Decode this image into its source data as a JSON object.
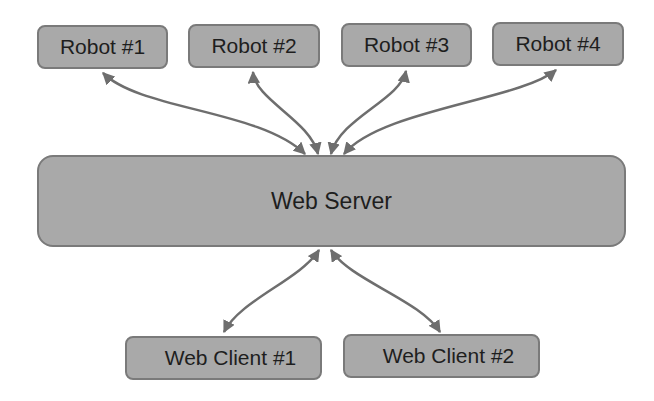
{
  "diagram": {
    "type": "architecture",
    "nodes": {
      "robots": [
        {
          "id": "robot-1",
          "label": "Robot #1"
        },
        {
          "id": "robot-2",
          "label": "Robot #2"
        },
        {
          "id": "robot-3",
          "label": "Robot #3"
        },
        {
          "id": "robot-4",
          "label": "Robot #4"
        }
      ],
      "server": {
        "id": "web-server",
        "label": "Web Server"
      },
      "clients": [
        {
          "id": "web-client-1",
          "label": "Web Client #1"
        },
        {
          "id": "web-client-2",
          "label": "Web Client #2"
        }
      ]
    },
    "edges": [
      {
        "from": "Robot #1",
        "to": "Web Server",
        "direction": "bidirectional"
      },
      {
        "from": "Robot #2",
        "to": "Web Server",
        "direction": "bidirectional"
      },
      {
        "from": "Robot #3",
        "to": "Web Server",
        "direction": "bidirectional"
      },
      {
        "from": "Robot #4",
        "to": "Web Server",
        "direction": "bidirectional"
      },
      {
        "from": "Web Client #1",
        "to": "Web Server",
        "direction": "bidirectional"
      },
      {
        "from": "Web Client #2",
        "to": "Web Server",
        "direction": "bidirectional"
      }
    ],
    "colors": {
      "node_fill": "#a9a9a9",
      "node_border": "#7a7a7a",
      "arrow": "#6e6e6e",
      "text": "#1e1e1e"
    }
  }
}
